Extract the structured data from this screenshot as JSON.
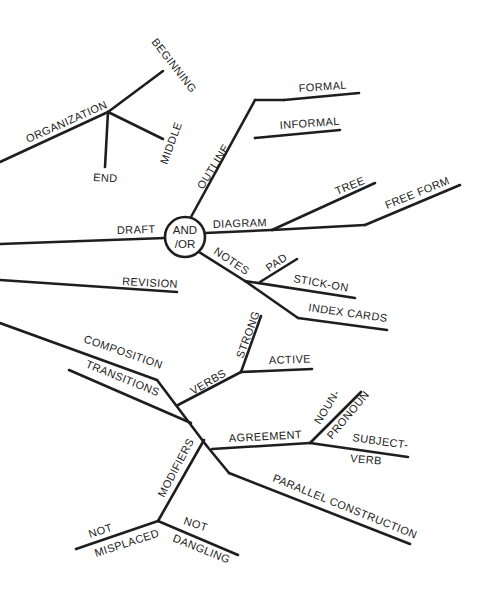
{
  "diagram": {
    "type": "mind-map",
    "center": {
      "line1": "AND",
      "line2": "/OR"
    },
    "labels": {
      "organization": "ORGANIZATION",
      "beginning": "BEGINNING",
      "middle": "MIDDLE",
      "end": "END",
      "outline": "OUTLINE",
      "formal": "FORMAL",
      "informal": "INFORMAL",
      "draft": "DRAFT",
      "diagram": "DIAGRAM",
      "tree": "TREE",
      "free_form": "FREE FORM",
      "notes": "NOTES",
      "pad": "PAD",
      "stick_on": "STICK-ON",
      "index_cards": "INDEX CARDS",
      "revision": "REVISION",
      "composition": "COMPOSITION",
      "transitions": "TRANSITIONS",
      "verbs": "VERBS",
      "strong": "STRONG",
      "active": "ACTIVE",
      "agreement": "AGREEMENT",
      "noun": "NOUN-",
      "pronoun": "PRONOUN",
      "subject": "SUBJECT-",
      "verb": "VERB",
      "parallel_construction": "PARALLEL CONSTRUCTION",
      "modifiers": "MODIFIERS",
      "not_misplaced_1": "NOT",
      "not_misplaced_2": "MISPLACED",
      "not_dangling_1": "NOT",
      "not_dangling_2": "DANGLING"
    },
    "colors": {
      "line": "#1e1e1e",
      "text": "#222222",
      "background": "#ffffff"
    }
  }
}
